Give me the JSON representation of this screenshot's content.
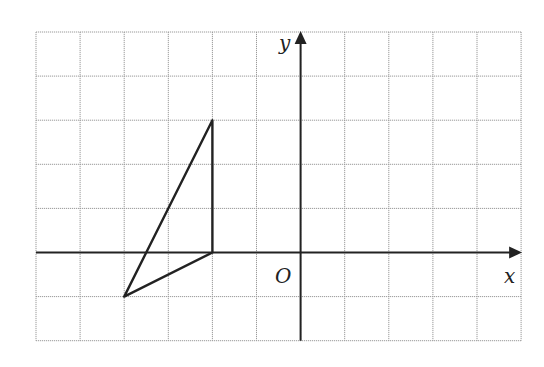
{
  "diagram": {
    "type": "coordinate-grid",
    "grid": {
      "columns": 11,
      "rows": 7,
      "x_range": [
        -6,
        5
      ],
      "y_range": [
        -2,
        5
      ],
      "line_color": "#9a9a9a"
    },
    "axes": {
      "x_label": "x",
      "y_label": "y",
      "origin_label": "O",
      "color": "#222222"
    },
    "triangle": {
      "vertices": [
        {
          "x": -2,
          "y": 3
        },
        {
          "x": -2,
          "y": 0
        },
        {
          "x": -4,
          "y": -1
        }
      ],
      "stroke": "#222222"
    }
  }
}
